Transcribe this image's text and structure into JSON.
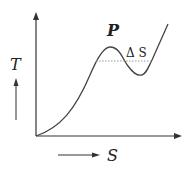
{
  "diagram": {
    "y_axis_label": "T",
    "x_axis_label": "S",
    "peak_label": "P",
    "delta_label": "Δ S",
    "curve_color": "#444444",
    "dotted_color": "#999999"
  }
}
